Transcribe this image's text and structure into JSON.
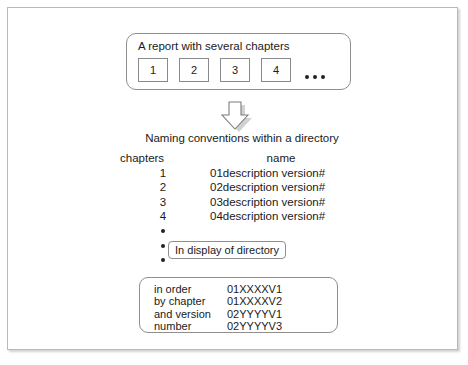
{
  "diagram": {
    "report_box": {
      "title": "A report with several chapters",
      "chapters": [
        "1",
        "2",
        "3",
        "4"
      ],
      "ellipsis": "..."
    },
    "arrow": {
      "icon": "arrow-down-block-icon",
      "direction": "down"
    },
    "naming_heading": "Naming conventions within a directory",
    "conventions": {
      "headers": [
        "chapters",
        "name"
      ],
      "rows": [
        {
          "chapter": "1",
          "name": "01description version#"
        },
        {
          "chapter": "2",
          "name": "02description version#"
        },
        {
          "chapter": "3",
          "name": "03description version#"
        },
        {
          "chapter": "4",
          "name": "04description version#"
        }
      ],
      "continuation_bullets": 3
    },
    "display_box": {
      "label": "In display of directory"
    },
    "example_box": {
      "rows": [
        {
          "label": "in order",
          "value": "01XXXXV1"
        },
        {
          "label": "by chapter",
          "value": "01XXXXV2"
        },
        {
          "label": "and version",
          "value": "02YYYYV1"
        },
        {
          "label": "number",
          "value": "02YYYYV3"
        }
      ]
    }
  },
  "colors": {
    "frame_border": "#b9b9b9",
    "box_border": "#8f8f8f",
    "text": "#1a1a1a",
    "shadow": "rgba(0,0,0,0.17)",
    "background": "#ffffff"
  }
}
